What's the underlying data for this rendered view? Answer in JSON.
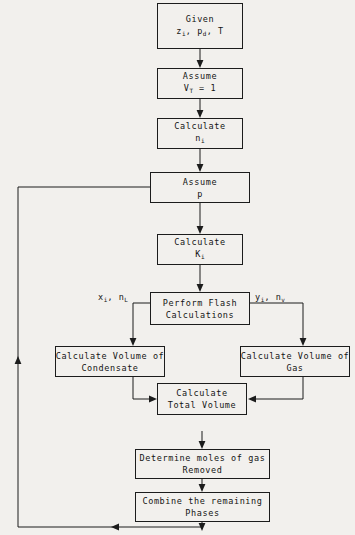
{
  "diagram": {
    "ink_color": "#1c1c1c",
    "background_color": "#f2f0ed",
    "nodes": [
      {
        "id": "given",
        "line1": "Given",
        "line2_pre": "z",
        "line2_sub1": "i",
        "line2_mid": ", p",
        "line2_sub2": "d",
        "line2_post": ", T"
      },
      {
        "id": "assume-vt",
        "line1": "Assume",
        "line2_pre": "V",
        "line2_sub1": "T",
        "line2_mid": " = 1",
        "line2_sub2": "",
        "line2_post": ""
      },
      {
        "id": "calc-ni",
        "line1": "Calculate",
        "line2_pre": "n",
        "line2_sub1": "i",
        "line2_mid": "",
        "line2_sub2": "",
        "line2_post": ""
      },
      {
        "id": "assume-p",
        "line1": "Assume",
        "line2_pre": "p",
        "line2_sub1": "",
        "line2_mid": "",
        "line2_sub2": "",
        "line2_post": ""
      },
      {
        "id": "calc-ki",
        "line1": "Calculate",
        "line2_pre": "K",
        "line2_sub1": "i",
        "line2_mid": "",
        "line2_sub2": "",
        "line2_post": ""
      },
      {
        "id": "flash",
        "line1": "Perform Flash",
        "line2_pre": "Calculations",
        "line2_sub1": "",
        "line2_mid": "",
        "line2_sub2": "",
        "line2_post": ""
      },
      {
        "id": "vol-cond",
        "line1": "Calculate Volume of",
        "line2_pre": "Condensate",
        "line2_sub1": "",
        "line2_mid": "",
        "line2_sub2": "",
        "line2_post": ""
      },
      {
        "id": "vol-gas",
        "line1": "Calculate Volume of",
        "line2_pre": "Gas",
        "line2_sub1": "",
        "line2_mid": "",
        "line2_sub2": "",
        "line2_post": ""
      },
      {
        "id": "total-vol",
        "line1": "Calculate",
        "line2_pre": "Total Volume",
        "line2_sub1": "",
        "line2_mid": "",
        "line2_sub2": "",
        "line2_post": ""
      },
      {
        "id": "moles-gas",
        "line1": "Determine moles of gas",
        "line2_pre": "Removed",
        "line2_sub1": "",
        "line2_mid": "",
        "line2_sub2": "",
        "line2_post": ""
      },
      {
        "id": "combine",
        "line1": "Combine the remaining",
        "line2_pre": "Phases",
        "line2_sub1": "",
        "line2_mid": "",
        "line2_sub2": "",
        "line2_post": ""
      }
    ],
    "edge_labels": {
      "liquid_pre": "x",
      "liquid_sub1": "i",
      "liquid_mid": ", n",
      "liquid_sub2": "L",
      "vapor_pre": "y",
      "vapor_sub1": "i",
      "vapor_mid": ", n",
      "vapor_sub2": "v"
    }
  }
}
